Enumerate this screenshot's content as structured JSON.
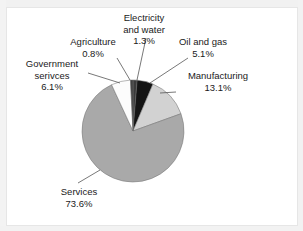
{
  "figure": {
    "background_color": "#ffffff",
    "frame_color": "#e6e6e6"
  },
  "chart_data": {
    "type": "pie",
    "title": "",
    "xlabel": "",
    "ylabel": "",
    "legend_position": "none",
    "labels_position": "outside-with-leader-lines",
    "start_angle_deg": 0,
    "direction": "clockwise",
    "categories": [
      "Electricity and water",
      "Oil and gas",
      "Manufacturing",
      "Services",
      "Government serivces",
      "Agriculture"
    ],
    "values": [
      1.3,
      5.1,
      13.1,
      73.6,
      6.1,
      0.8
    ],
    "value_unit": "%",
    "colors": [
      "#3a3a3a",
      "#141414",
      "#d2d2d2",
      "#a9a9a9",
      "#fcfcfc",
      "#3f3f3f"
    ],
    "slices": [
      {
        "name": "Electricity and water",
        "label_line1": "Electricity",
        "label_line2": "and water",
        "value": 1.3,
        "value_text": "1.3%",
        "color": "#3a3a3a"
      },
      {
        "name": "Oil and gas",
        "label_line1": "Oil and gas",
        "label_line2": "",
        "value": 5.1,
        "value_text": "5.1%",
        "color": "#141414"
      },
      {
        "name": "Manufacturing",
        "label_line1": "Manufacturing",
        "label_line2": "",
        "value": 13.1,
        "value_text": "13.1%",
        "color": "#d2d2d2"
      },
      {
        "name": "Services",
        "label_line1": "Services",
        "label_line2": "",
        "value": 73.6,
        "value_text": "73.6%",
        "color": "#a9a9a9"
      },
      {
        "name": "Government serivces",
        "label_line1": "Government",
        "label_line2": "serivces",
        "value": 6.1,
        "value_text": "6.1%",
        "color": "#fcfcfc"
      },
      {
        "name": "Agriculture",
        "label_line1": "Agriculture",
        "label_line2": "",
        "value": 0.8,
        "value_text": "0.8%",
        "color": "#3f3f3f"
      }
    ]
  }
}
